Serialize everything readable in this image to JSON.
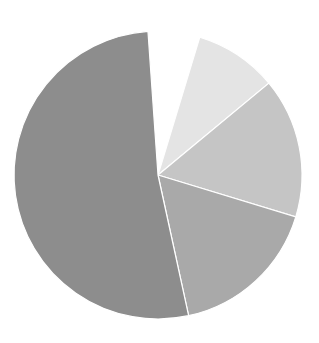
{
  "chart_data": {
    "type": "pie",
    "title": "",
    "center": [
      158,
      175
    ],
    "radius": 144,
    "start_angle_deg": 356,
    "direction": "clockwise",
    "slice_border_color": "#ffffff",
    "legend": "none",
    "labels_shown": false,
    "slices": [
      {
        "name": "gap",
        "value": 5.8,
        "color": "#ffffff"
      },
      {
        "name": "slice-1",
        "value": 9.3,
        "color": "#e4e4e4"
      },
      {
        "name": "slice-2",
        "value": 15.7,
        "color": "#c5c5c5"
      },
      {
        "name": "slice-3",
        "value": 16.9,
        "color": "#a9a9a9"
      },
      {
        "name": "slice-4",
        "value": 52.3,
        "color": "#8d8d8d"
      }
    ]
  }
}
